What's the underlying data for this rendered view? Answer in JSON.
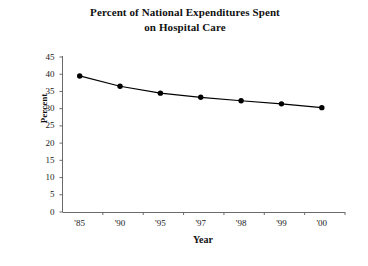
{
  "chart_data": {
    "type": "line",
    "title": "Percent of National Expenditures Spent on Hospital Care",
    "title_lines": [
      "Percent of National Expenditures Spent",
      "on Hospital Care"
    ],
    "xlabel": "Year",
    "ylabel": "Percent",
    "categories": [
      "'85",
      "'90",
      "'95",
      "'97",
      "'98",
      "'99",
      "'00"
    ],
    "values": [
      39.5,
      36.5,
      34.5,
      33.3,
      32.3,
      31.4,
      30.3
    ],
    "series": [
      {
        "name": "Percent of National Expenditures Spent on Hospital Care",
        "values": [
          39.5,
          36.5,
          34.5,
          33.3,
          32.3,
          31.4,
          30.3
        ]
      }
    ],
    "ylim": [
      0,
      45
    ],
    "ytick_labels": [
      "0",
      "5",
      "10",
      "15",
      "20",
      "25",
      "30",
      "35",
      "40",
      "45"
    ],
    "ytick_values": [
      0,
      5,
      10,
      15,
      20,
      25,
      30,
      35,
      40,
      45
    ],
    "xtick_labels": [
      "'85",
      "'90",
      "'95",
      "'97",
      "'98",
      "'99",
      "'00"
    ],
    "grid": false,
    "legend": false,
    "legend_position": "none",
    "marker": "filled-circle",
    "line_color": "#000000",
    "marker_color": "#000000",
    "axis_color": "#555555",
    "background_color": "#ffffff"
  }
}
